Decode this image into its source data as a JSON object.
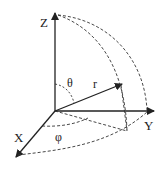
{
  "diagram": {
    "type": "spherical-coordinates",
    "axes": {
      "z_label": "Z",
      "y_label": "Y",
      "x_label": "X"
    },
    "vector_label": "r",
    "polar_angle_label": "θ",
    "azimuth_angle_label": "φ",
    "colors": {
      "stroke": "#222222",
      "background": "#ffffff"
    }
  }
}
